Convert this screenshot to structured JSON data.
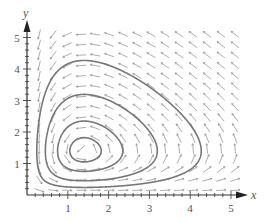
{
  "chart_data": {
    "type": "line",
    "subtype": "phase-portrait-direction-field",
    "title": "",
    "xlabel": "x",
    "ylabel": "y",
    "xlim": [
      0,
      5.3
    ],
    "ylim": [
      0,
      5.3
    ],
    "x_ticks": [
      "1",
      "2",
      "3",
      "4",
      "5"
    ],
    "y_ticks": [
      "1",
      "2",
      "3",
      "4",
      "5"
    ],
    "grid": false,
    "legend": "none",
    "equilibrium": {
      "x": 1.4,
      "y": 1.4
    },
    "direction_field": {
      "x_range": [
        0.3,
        5.1
      ],
      "y_range": [
        0.15,
        5.1
      ],
      "cols": 15,
      "rows": 16
    },
    "series": [
      {
        "name": "orbit-innermost",
        "start": {
          "x": 1.4,
          "y": 1.05
        }
      },
      {
        "name": "orbit-2",
        "start": {
          "x": 1.4,
          "y": 0.75
        }
      },
      {
        "name": "orbit-3",
        "start": {
          "x": 1.4,
          "y": 0.45
        }
      },
      {
        "name": "orbit-outer",
        "start": {
          "x": 1.4,
          "y": 0.24
        }
      }
    ],
    "colors": {
      "curve": "#777777",
      "field": "#8a8a8a",
      "axis": "#333333"
    }
  }
}
